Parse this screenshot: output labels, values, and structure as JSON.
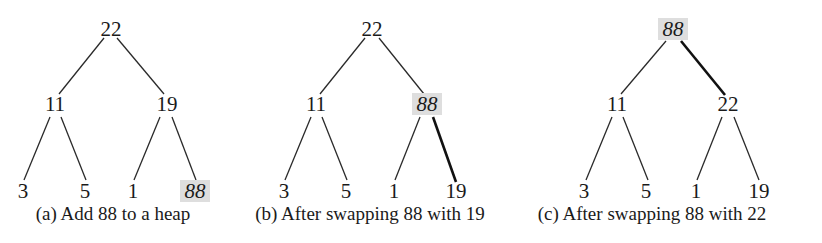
{
  "figure": {
    "highlight_color": "#dedede",
    "edge_color": "#2a2a2a",
    "panels": [
      {
        "id": "a",
        "caption": "(a) Add 88 to a heap",
        "caption_pos": {
          "x": 113,
          "y": 220
        },
        "nodes": [
          {
            "id": "root",
            "label": "22",
            "x": 111,
            "y": 29,
            "highlight": false
          },
          {
            "id": "l",
            "label": "11",
            "x": 55,
            "y": 104,
            "highlight": false
          },
          {
            "id": "r",
            "label": "19",
            "x": 167,
            "y": 104,
            "highlight": false
          },
          {
            "id": "ll",
            "label": "3",
            "x": 23,
            "y": 191,
            "highlight": false
          },
          {
            "id": "lr",
            "label": "5",
            "x": 85,
            "y": 191,
            "highlight": false
          },
          {
            "id": "rl",
            "label": "1",
            "x": 133,
            "y": 191,
            "highlight": false
          },
          {
            "id": "rr",
            "label": "88",
            "x": 195,
            "y": 191,
            "highlight": true
          }
        ],
        "edges": [
          {
            "x1": 104,
            "y1": 38,
            "x2": 59,
            "y2": 94,
            "bold": false
          },
          {
            "x1": 117,
            "y1": 38,
            "x2": 164,
            "y2": 94,
            "bold": false
          },
          {
            "x1": 50,
            "y1": 117,
            "x2": 24,
            "y2": 180,
            "bold": false
          },
          {
            "x1": 61,
            "y1": 117,
            "x2": 86,
            "y2": 180,
            "bold": false
          },
          {
            "x1": 160,
            "y1": 117,
            "x2": 134,
            "y2": 180,
            "bold": false
          },
          {
            "x1": 172,
            "y1": 117,
            "x2": 196,
            "y2": 180,
            "bold": false
          }
        ]
      },
      {
        "id": "b",
        "caption": "(b) After swapping 88 with 19",
        "caption_pos": {
          "x": 370,
          "y": 220
        },
        "nodes": [
          {
            "id": "root",
            "label": "22",
            "x": 372,
            "y": 29,
            "highlight": false
          },
          {
            "id": "l",
            "label": "11",
            "x": 316,
            "y": 104,
            "highlight": false
          },
          {
            "id": "r",
            "label": "88",
            "x": 427,
            "y": 104,
            "highlight": true
          },
          {
            "id": "ll",
            "label": "3",
            "x": 284,
            "y": 191,
            "highlight": false
          },
          {
            "id": "lr",
            "label": "5",
            "x": 346,
            "y": 191,
            "highlight": false
          },
          {
            "id": "rl",
            "label": "1",
            "x": 394,
            "y": 191,
            "highlight": false
          },
          {
            "id": "rr",
            "label": "19",
            "x": 456,
            "y": 191,
            "highlight": false
          }
        ],
        "edges": [
          {
            "x1": 365,
            "y1": 38,
            "x2": 320,
            "y2": 94,
            "bold": false
          },
          {
            "x1": 379,
            "y1": 38,
            "x2": 424,
            "y2": 94,
            "bold": false
          },
          {
            "x1": 311,
            "y1": 117,
            "x2": 285,
            "y2": 180,
            "bold": false
          },
          {
            "x1": 322,
            "y1": 117,
            "x2": 347,
            "y2": 180,
            "bold": false
          },
          {
            "x1": 420,
            "y1": 117,
            "x2": 395,
            "y2": 180,
            "bold": false
          },
          {
            "x1": 433,
            "y1": 117,
            "x2": 456,
            "y2": 182,
            "bold": true
          }
        ]
      },
      {
        "id": "c",
        "caption": "(c) After swapping 88 with 22",
        "caption_pos": {
          "x": 652,
          "y": 220
        },
        "nodes": [
          {
            "id": "root",
            "label": "88",
            "x": 673,
            "y": 29,
            "highlight": true
          },
          {
            "id": "l",
            "label": "11",
            "x": 617,
            "y": 104,
            "highlight": false
          },
          {
            "id": "r",
            "label": "22",
            "x": 728,
            "y": 104,
            "highlight": false
          },
          {
            "id": "ll",
            "label": "3",
            "x": 584,
            "y": 191,
            "highlight": false
          },
          {
            "id": "lr",
            "label": "5",
            "x": 646,
            "y": 191,
            "highlight": false
          },
          {
            "id": "rl",
            "label": "1",
            "x": 696,
            "y": 191,
            "highlight": false
          },
          {
            "id": "rr",
            "label": "19",
            "x": 759,
            "y": 191,
            "highlight": false
          }
        ],
        "edges": [
          {
            "x1": 666,
            "y1": 41,
            "x2": 621,
            "y2": 94,
            "bold": false
          },
          {
            "x1": 681,
            "y1": 41,
            "x2": 725,
            "y2": 95,
            "bold": true
          },
          {
            "x1": 612,
            "y1": 117,
            "x2": 586,
            "y2": 180,
            "bold": false
          },
          {
            "x1": 623,
            "y1": 117,
            "x2": 648,
            "y2": 180,
            "bold": false
          },
          {
            "x1": 722,
            "y1": 117,
            "x2": 697,
            "y2": 180,
            "bold": false
          },
          {
            "x1": 734,
            "y1": 117,
            "x2": 759,
            "y2": 180,
            "bold": false
          }
        ]
      }
    ]
  }
}
